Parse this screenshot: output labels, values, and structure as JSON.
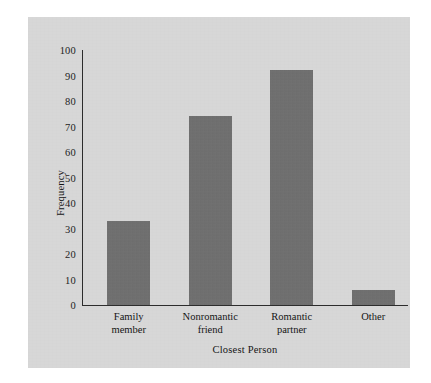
{
  "figure": {
    "background_color": "#ffffff",
    "panel_color": "#d7d7d7",
    "bar_color": "#6f6f6f",
    "axis_color": "#2b2b2b"
  },
  "chart_data": {
    "type": "bar",
    "title": "",
    "xlabel": "Closest Person",
    "ylabel": "Frequency",
    "categories": [
      "Family member",
      "Nonromantic friend",
      "Romantic partner",
      "Other"
    ],
    "category_lines": [
      [
        "Family",
        "member"
      ],
      [
        "Nonromantic",
        "friend"
      ],
      [
        "Romantic",
        "partner"
      ],
      [
        "Other"
      ]
    ],
    "values": [
      33,
      74,
      92,
      6
    ],
    "ylim": [
      0,
      100
    ],
    "yticks": [
      0,
      10,
      20,
      30,
      40,
      50,
      60,
      70,
      80,
      90,
      100
    ],
    "ytick_labels": [
      "0",
      "10",
      "20",
      "30",
      "40",
      "50",
      "60",
      "70",
      "80",
      "90",
      "100"
    ],
    "grid": false,
    "legend": null,
    "bar_color": "#6f6f6f"
  }
}
